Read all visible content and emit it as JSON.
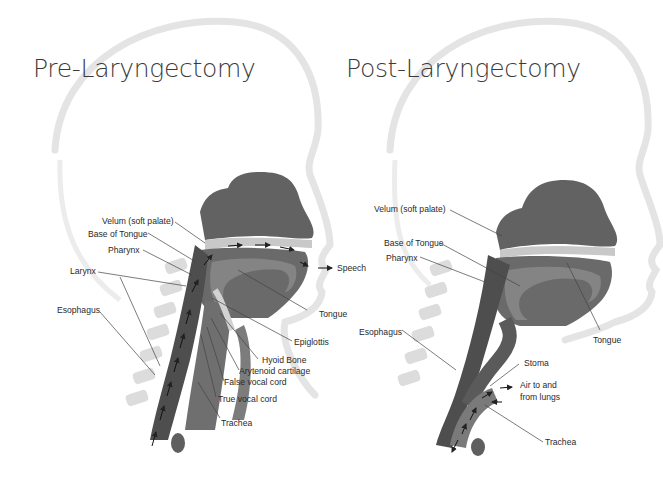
{
  "panels": [
    {
      "id": "pre",
      "title": "Pre-Laryngectomy",
      "labels": {
        "velum": "Velum (soft palate)",
        "base_of_tongue": "Base of Tongue",
        "pharynx": "Pharynx",
        "larynx": "Larynx",
        "esophagus": "Esophagus",
        "speech": "Speech",
        "tongue": "Tongue",
        "epiglottis": "Epiglottis",
        "hyoid_bone": "Hyoid Bone",
        "arytenoid_cartilage": "Arytenoid cartilage",
        "false_vocal_cord": "False vocal cord",
        "true_vocal_cord": "True vocal cord",
        "trachea": "Trachea"
      }
    },
    {
      "id": "post",
      "title": "Post-Laryngectomy",
      "labels": {
        "velum": "Velum (soft palate)",
        "base_of_tongue": "Base of Tongue",
        "pharynx": "Pharynx",
        "esophagus": "Esophagus",
        "tongue": "Tongue",
        "stoma": "Stoma",
        "air_line1": "Air to and",
        "air_line2": "from lungs",
        "trachea": "Trachea"
      }
    }
  ],
  "colors": {
    "head_outline": "#e6e6e6",
    "tissue_dark": "#5e5e5e",
    "tissue_mid": "#7a7a7a",
    "tissue_light": "#a9a9a9",
    "spine": "#d9d9d9",
    "leader_line": "#444444",
    "text": "#2a2a2a"
  }
}
